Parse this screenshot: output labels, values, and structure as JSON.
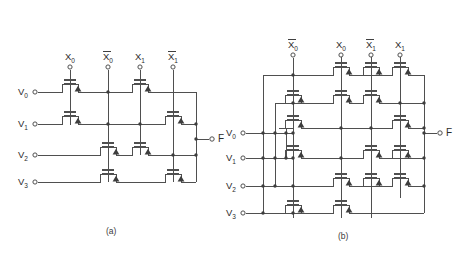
{
  "figure": {
    "line_color": "#4f4f4f",
    "text_color": "#2b2b2b",
    "background": "#ffffff"
  },
  "panels": [
    {
      "id": "a",
      "caption": "(a)",
      "output_label": "F",
      "column_labels": [
        {
          "base": "X",
          "sub": "0",
          "overbar": false,
          "name": "x0"
        },
        {
          "base": "X",
          "sub": "0",
          "overbar": true,
          "name": "x0-bar"
        },
        {
          "base": "X",
          "sub": "1",
          "overbar": false,
          "name": "x1"
        },
        {
          "base": "X",
          "sub": "1",
          "overbar": true,
          "name": "x1-bar"
        }
      ],
      "row_labels": [
        {
          "base": "V",
          "sub": "0",
          "name": "v0"
        },
        {
          "base": "V",
          "sub": "1",
          "name": "v1"
        },
        {
          "base": "V",
          "sub": "2",
          "name": "v2"
        },
        {
          "base": "V",
          "sub": "3",
          "name": "v3"
        }
      ],
      "transistor_count": 8,
      "transistors": [
        {
          "row": "V0",
          "column": "X0",
          "name": "pass-transistor-a-r0-x0"
        },
        {
          "row": "V0",
          "column": "X1",
          "name": "pass-transistor-a-r0-x1"
        },
        {
          "row": "V1",
          "column": "X0",
          "name": "pass-transistor-a-r1-x0"
        },
        {
          "row": "V1",
          "column": "X1-bar",
          "name": "pass-transistor-a-r1-x1bar"
        },
        {
          "row": "V2",
          "column": "X0-bar",
          "name": "pass-transistor-a-r2-x0bar"
        },
        {
          "row": "V2",
          "column": "X1",
          "name": "pass-transistor-a-r2-x1"
        },
        {
          "row": "V3",
          "column": "X0-bar",
          "name": "pass-transistor-a-r3-x0bar"
        },
        {
          "row": "V3",
          "column": "X1-bar",
          "name": "pass-transistor-a-r3-x1bar"
        }
      ]
    },
    {
      "id": "b",
      "caption": "(b)",
      "output_label": "F",
      "column_labels": [
        {
          "base": "X",
          "sub": "0",
          "overbar": true,
          "name": "x0-bar"
        },
        {
          "base": "X",
          "sub": "0",
          "overbar": false,
          "name": "x0"
        },
        {
          "base": "X",
          "sub": "1",
          "overbar": true,
          "name": "x1-bar"
        },
        {
          "base": "X",
          "sub": "1",
          "overbar": false,
          "name": "x1"
        }
      ],
      "row_labels": [
        {
          "base": "V",
          "sub": "0",
          "name": "v0"
        },
        {
          "base": "V",
          "sub": "1",
          "name": "v1"
        },
        {
          "base": "V",
          "sub": "2",
          "name": "v2"
        },
        {
          "base": "V",
          "sub": "3",
          "name": "v3"
        }
      ],
      "transistor_count": 16,
      "rows": 6
    }
  ]
}
